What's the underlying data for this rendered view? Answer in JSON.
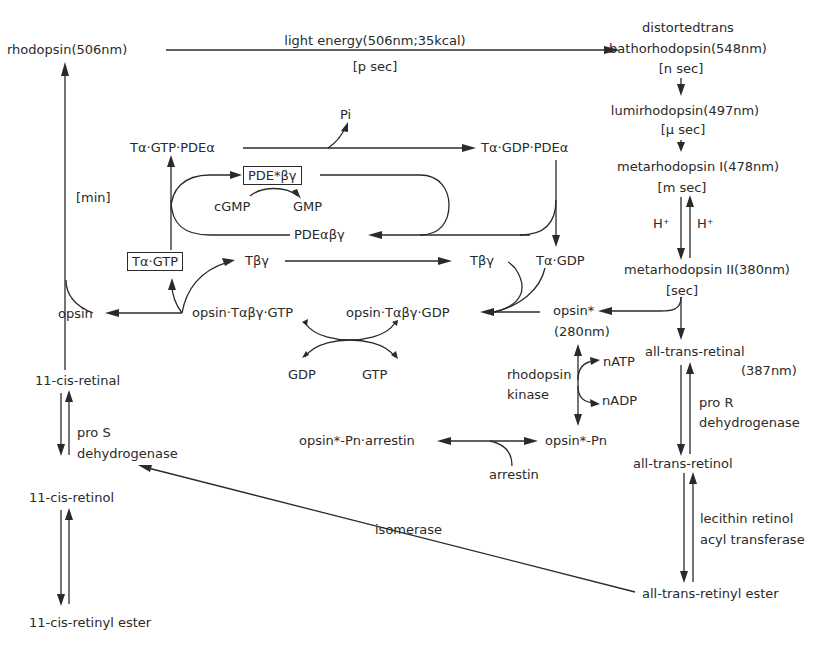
{
  "diagram": {
    "nodes": {
      "rhodopsin": "rhodopsin(506nm)",
      "light_energy": "light energy(506nm;35kcal)",
      "p_sec": "[p sec]",
      "distortedtrans": "distortedtrans",
      "bathorhodopsin": "bathorhodopsin(548nm)",
      "n_sec": "[n sec]",
      "lumirhodopsin": "lumirhodopsin(497nm)",
      "mu_sec": "[μ  sec]",
      "metarhodopsin_1": "metarhodopsin I(478nm)",
      "m_sec": "[m sec]",
      "h_plus_left": "H⁺",
      "h_plus_right": "H⁺",
      "metarhodopsin_2": "metarhodopsin II(380nm)",
      "sec": "[sec]",
      "min": "[min]",
      "t_alpha_gtp_pde_alpha": "Tα·GTP·PDEα",
      "pi": "Pi",
      "t_alpha_gdp_pde_alpha": "Tα·GDP·PDEα",
      "pde_star_beta_gamma": "PDE*βγ",
      "cgmp": "cGMP",
      "gmp": "GMP",
      "pde_alpha_beta_gamma": "PDEαβγ",
      "t_alpha_gtp_boxed": "Tα·GTP",
      "t_beta_gamma_left": "Tβγ",
      "t_beta_gamma_right": "Tβγ",
      "t_alpha_gdp": "Tα·GDP",
      "opsin": "opsin",
      "opsin_t_gtp": "opsin·Tαβγ·GTP",
      "opsin_t_gdp": "opsin·Tαβγ·GDP",
      "opsin_star": "opsin*",
      "opsin_star_nm": "(280nm)",
      "gdp": "GDP",
      "gtp": "GTP",
      "rhodopsin_kinase_1": "rhodopsin",
      "rhodopsin_kinase_2": "kinase",
      "natp": "nATP",
      "nadp": "nADP",
      "opsin_pn_arrestin": "opsin*-Pn·arrestin",
      "opsin_pn": "opsin*-Pn",
      "arrestin": "arrestin",
      "all_trans_retinal": "all-trans-retinal",
      "all_trans_retinal_nm": "(387nm)",
      "pro_r": "pro R",
      "dehydrogenase_r": "dehydrogenase",
      "all_trans_retinol": "all-trans-retinol",
      "lecithin_1": "lecithin retinol",
      "lecithin_2": "acyl transferase",
      "all_trans_retinyl_ester": "all-trans-retinyl ester",
      "isomerase": "isomerase",
      "cis_retinal": "11-cis-retinal",
      "pro_s": "pro S",
      "dehydrogenase_s": "dehydrogenase",
      "cis_retinol": "11-cis-retinol",
      "cis_retinyl_ester": "11-cis-retinyl ester"
    }
  }
}
